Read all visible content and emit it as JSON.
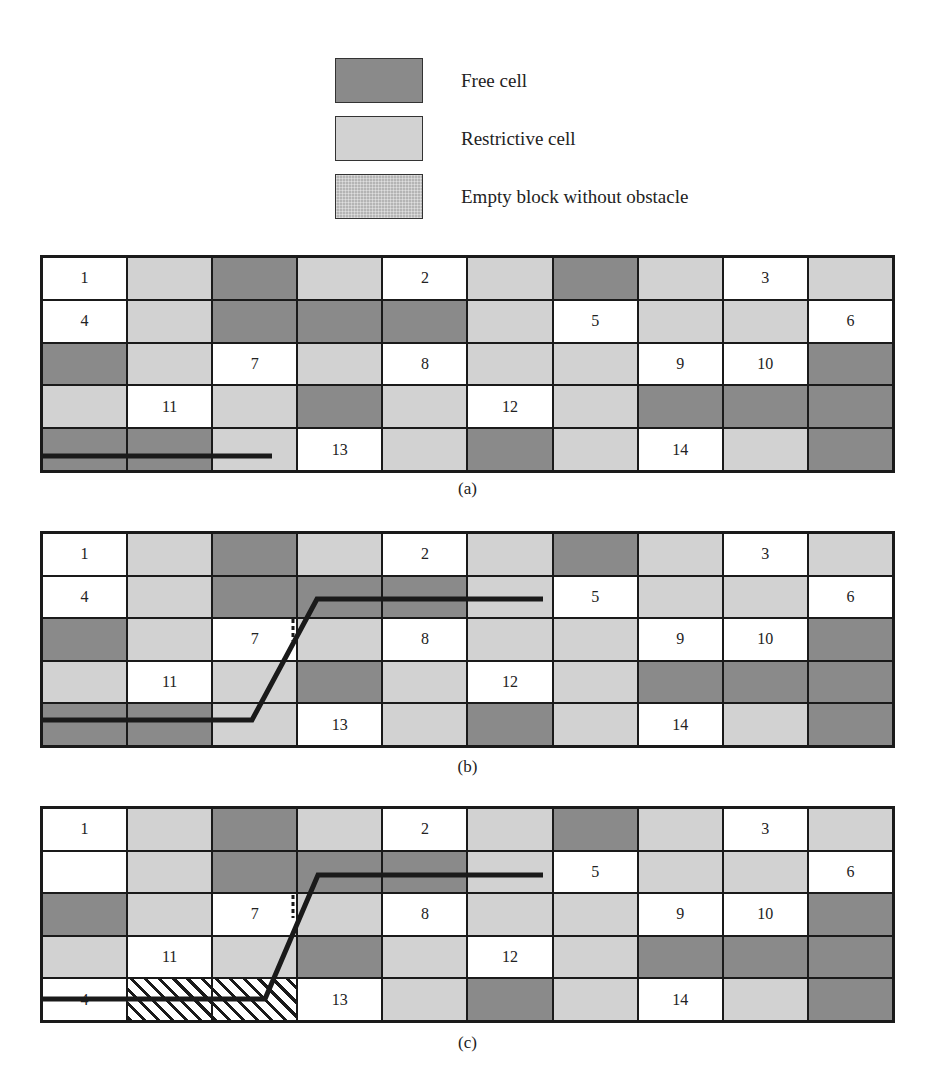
{
  "legend": [
    {
      "label": "Free cell",
      "swatch": "dark"
    },
    {
      "label": "Restrictive cell",
      "swatch": "light"
    },
    {
      "label": "Empty block without obstacle",
      "swatch": "empty"
    }
  ],
  "colors": {
    "free": "#8a8a8a",
    "restrictive": "#d2d2d2",
    "numbered": "#ffffff",
    "line": "#1a1a1a"
  },
  "panels": [
    {
      "caption": "(a)",
      "rows": [
        [
          "W:1",
          "L",
          "D",
          "L",
          "W:2",
          "L",
          "D",
          "L",
          "W:3",
          "L"
        ],
        [
          "W:4",
          "L",
          "D",
          "D",
          "D",
          "L",
          "W:5",
          "L",
          "L",
          "W:6"
        ],
        [
          "D",
          "L",
          "W:7",
          "L",
          "W:8",
          "L",
          "L",
          "W:9",
          "W:10",
          "D"
        ],
        [
          "L",
          "W:11",
          "L",
          "D",
          "L",
          "W:12",
          "L",
          "D",
          "D",
          "D"
        ],
        [
          "D",
          "D",
          "L",
          "W:13",
          "L",
          "D",
          "L",
          "W:14",
          "L",
          "D"
        ]
      ],
      "path": "M0,201 L232,201",
      "dashed": ""
    },
    {
      "caption": "(b)",
      "rows": [
        [
          "W:1",
          "L",
          "D",
          "L",
          "W:2",
          "L",
          "D",
          "L",
          "W:3",
          "L"
        ],
        [
          "W:4",
          "L",
          "D",
          "D",
          "D",
          "L",
          "W:5",
          "L",
          "L",
          "W:6"
        ],
        [
          "D",
          "L",
          "W:7",
          "L",
          "W:8",
          "L",
          "L",
          "W:9",
          "W:10",
          "D"
        ],
        [
          "L",
          "W:11",
          "L",
          "D",
          "L",
          "W:12",
          "L",
          "D",
          "D",
          "D"
        ],
        [
          "D",
          "D",
          "L",
          "W:13",
          "L",
          "D",
          "L",
          "W:14",
          "L",
          "D"
        ]
      ],
      "path": "M0,189 L212,189 L277,68 L503,68",
      "dashed": "M253,88 L253,110"
    },
    {
      "caption": "(c)",
      "rows": [
        [
          "W:1",
          "L",
          "D",
          "L",
          "W:2",
          "L",
          "D",
          "L",
          "W:3",
          "L"
        ],
        [
          "W",
          "L",
          "D",
          "D",
          "D",
          "L",
          "W:5",
          "L",
          "L",
          "W:6"
        ],
        [
          "D",
          "L",
          "W:7",
          "L",
          "W:8",
          "L",
          "L",
          "W:9",
          "W:10",
          "D"
        ],
        [
          "L",
          "W:11",
          "L",
          "D",
          "L",
          "W:12",
          "L",
          "D",
          "D",
          "D"
        ],
        [
          "W:4",
          "H",
          "H",
          "W:13",
          "L",
          "D",
          "L",
          "W:14",
          "L",
          "D"
        ]
      ],
      "path": "M0,193 L225,193 L278,69 L503,69",
      "dashed": "M253,89 L253,112"
    }
  ]
}
